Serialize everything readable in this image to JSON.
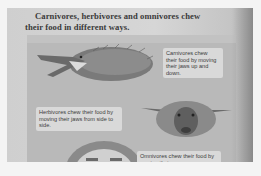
{
  "page": {
    "heading_line1": "Carnivores, herbivores and omnivores chew",
    "heading_line2": "their food in different ways."
  },
  "captions": {
    "carnivores": "Carnivores chew their food by moving their jaws up and down.",
    "herbivores": "Herbivores chew their food by moving their jaws from side to side.",
    "omnivores": "Omnivores chew their food by moving their"
  },
  "illustrations": {
    "carnivore": "hedgehog-like carnivore with open jaws",
    "herbivore": "sheep head",
    "omnivore": "human face"
  },
  "colors": {
    "page_bg": "#d2d2d2",
    "panel_bg": "#b9b9b9",
    "caption_bg": "#d9d9d9",
    "text": "#3a3a3a"
  }
}
